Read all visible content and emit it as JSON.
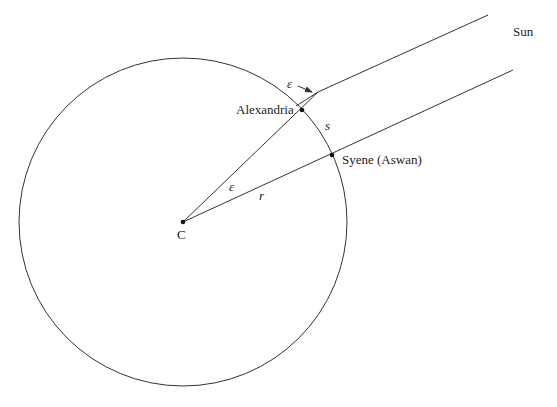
{
  "diagram": {
    "labels": {
      "sun": "Sun",
      "alexandria": "Alexandria",
      "syene": "Syene (Aswan)",
      "center": "C",
      "angle_top": "ε",
      "angle_center": "ε",
      "arc": "s",
      "radius": "r"
    },
    "colors": {
      "stroke": "#333333",
      "text": "#222222",
      "background": "#ffffff"
    },
    "geometry": {
      "circle": {
        "cx": 183,
        "cy": 222,
        "r": 164
      },
      "center_point": {
        "x": 183,
        "y": 222
      },
      "alexandria_point": {
        "x": 302,
        "y": 110
      },
      "syene_point": {
        "x": 332,
        "y": 155
      },
      "upper_ray": {
        "x1": 318,
        "y1": 92,
        "x2": 488,
        "y2": 15
      },
      "lower_ray": {
        "x1": 183,
        "y1": 222,
        "x2": 513,
        "y2": 70
      }
    }
  }
}
